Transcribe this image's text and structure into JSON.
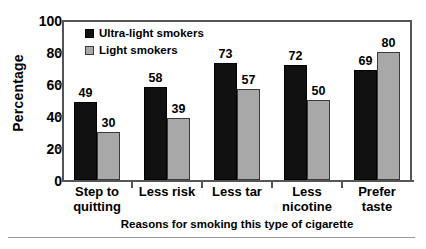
{
  "chart_data": {
    "type": "bar",
    "title": "",
    "xlabel": "Reasons for smoking this type of cigarette",
    "ylabel": "Percentage",
    "ylim": [
      0,
      100
    ],
    "yticks": [
      0,
      20,
      40,
      60,
      80,
      100
    ],
    "grid": false,
    "legend_position": "top-left inside plot",
    "categories": [
      "Step to quitting",
      "Less risk",
      "Less tar",
      "Less nicotine",
      "Prefer taste"
    ],
    "category_lines": [
      [
        "Step to",
        "quitting"
      ],
      [
        "Less risk",
        ""
      ],
      [
        "Less tar",
        ""
      ],
      [
        "Less",
        "nicotine"
      ],
      [
        "Prefer",
        "taste"
      ]
    ],
    "series": [
      {
        "name": "Ultra-light smokers",
        "color": "#111111",
        "values": [
          49,
          58,
          73,
          72,
          69
        ]
      },
      {
        "name": "Light smokers",
        "color": "#a8a8a8",
        "values": [
          30,
          39,
          57,
          50,
          80
        ]
      }
    ]
  }
}
